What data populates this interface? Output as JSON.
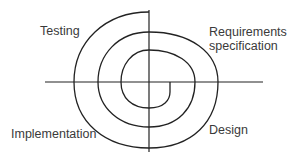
{
  "diagram": {
    "type": "spiral-model",
    "labels": {
      "testing": "Testing",
      "requirements_line1": "Requirements",
      "requirements_line2": "specification",
      "design": "Design",
      "implementation": "Implementation"
    },
    "colors": {
      "stroke": "#222222",
      "text": "#3a3a3a",
      "background": "#ffffff"
    },
    "axes": {
      "vertical": {
        "x": 149,
        "y1": 10,
        "y2": 152
      },
      "horizontal": {
        "y": 82,
        "x1": 45,
        "x2": 263
      }
    },
    "spiral_path": "M149,12 C105,12 74,42 74,82 C74,122 105,148 149,148 C192,148 218,122 218,82 C218,52 190,32 149,32 C118,32 98,55 98,82 C98,108 120,127 149,127 C178,127 195,108 195,82 C195,62 175,50 149,50 C132,50 121,65 121,82 C121,98 132,108 149,108 C164,108 170,100 170,92 L170,82",
    "quadrants": [
      {
        "position": "top-left",
        "phase": "Testing"
      },
      {
        "position": "top-right",
        "phase": "Requirements specification"
      },
      {
        "position": "bottom-right",
        "phase": "Design"
      },
      {
        "position": "bottom-left",
        "phase": "Implementation"
      }
    ]
  }
}
